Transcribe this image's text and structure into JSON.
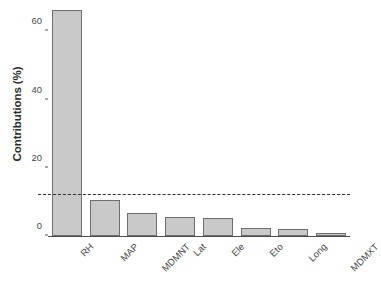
{
  "chart_data": {
    "type": "bar",
    "title": "",
    "xlabel": "",
    "ylabel": "Contributions (%)",
    "categories": [
      "RH",
      "MAP",
      "MDMNT",
      "Lat",
      "Ele",
      "Eto",
      "Long",
      "MDMXT"
    ],
    "values": [
      66.2,
      10.7,
      6.8,
      5.6,
      5.3,
      2.3,
      2.0,
      0.9
    ],
    "ylim": [
      0,
      68
    ],
    "yticks": [
      0,
      20,
      40,
      60
    ],
    "ytick_labels": [
      "0",
      "20",
      "40",
      "60"
    ],
    "grid": false,
    "legend": "none",
    "annotations": [
      {
        "name": "threshold-line",
        "type": "horizontal-dashed-line",
        "value": 12.1,
        "style": "dashed",
        "color": "#2e2e2e"
      }
    ],
    "bar_fill_color": "#c9c9c9",
    "bar_border_color": "#6e6e6e",
    "background_color": "#ffffff"
  }
}
